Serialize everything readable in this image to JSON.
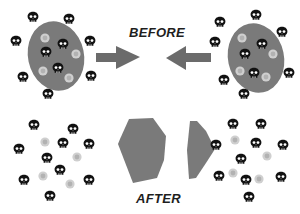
{
  "labels": {
    "before": "BEFORE",
    "after": "AFTER"
  },
  "colors": {
    "background": "#ffffff",
    "cell_body": "#7a7a7a",
    "arrow": "#6b6b6b",
    "skull": "#111111",
    "skull_eyes": "#ffffff",
    "light_particle": "#cfcfcf",
    "light_particle_center": "#a9a9a9"
  },
  "icons": {
    "skull": "skull-icon",
    "light_particle": "circle-icon",
    "arrow_right": "arrow-right-icon",
    "arrow_left": "arrow-left-icon"
  },
  "before": {
    "left_cell": {
      "ellipse": {
        "cx": 56,
        "cy": 56,
        "rx": 28,
        "ry": 35,
        "rotate": -12
      },
      "outer_skulls": [
        [
          33,
          17
        ],
        [
          69,
          19
        ],
        [
          16,
          41
        ],
        [
          90,
          41
        ],
        [
          23,
          77
        ],
        [
          91,
          76
        ],
        [
          48,
          94
        ]
      ],
      "inner_skulls": [
        [
          63,
          44
        ],
        [
          46,
          52
        ],
        [
          58,
          68
        ]
      ],
      "light_particles": [
        [
          45,
          38
        ],
        [
          76,
          54
        ],
        [
          43,
          71
        ],
        [
          69,
          78
        ]
      ]
    },
    "right_cell": {
      "ellipse": {
        "cx": 256,
        "cy": 58,
        "rx": 28,
        "ry": 35,
        "rotate": -12
      },
      "outer_skulls": [
        [
          220,
          22
        ],
        [
          256,
          15
        ],
        [
          282,
          32
        ],
        [
          215,
          42
        ],
        [
          289,
          73
        ],
        [
          224,
          80
        ],
        [
          244,
          94
        ]
      ],
      "inner_skulls": [
        [
          262,
          44
        ],
        [
          245,
          54
        ],
        [
          254,
          73
        ]
      ],
      "light_particles": [
        [
          242,
          38
        ],
        [
          273,
          54
        ],
        [
          240,
          71
        ],
        [
          266,
          77
        ]
      ]
    },
    "arrow_right": {
      "shaft": [
        96,
        53,
        116,
        62
      ],
      "head": [
        [
          116,
          46
        ],
        [
          140,
          57
        ],
        [
          116,
          69
        ]
      ]
    },
    "arrow_left": {
      "shaft": [
        186,
        53,
        211,
        62
      ],
      "head": [
        [
          186,
          46
        ],
        [
          166,
          58
        ],
        [
          186,
          70
        ]
      ]
    }
  },
  "after": {
    "left_group": {
      "skulls": [
        [
          34,
          125
        ],
        [
          73,
          129
        ],
        [
          19,
          149
        ],
        [
          63,
          143
        ],
        [
          89,
          144
        ],
        [
          47,
          158
        ],
        [
          60,
          170
        ],
        [
          24,
          180
        ],
        [
          89,
          180
        ],
        [
          50,
          196
        ]
      ],
      "light_particles": [
        [
          45,
          142
        ],
        [
          77,
          157
        ],
        [
          43,
          176
        ],
        [
          70,
          184
        ]
      ]
    },
    "right_group": {
      "skulls": [
        [
          233,
          124
        ],
        [
          261,
          124
        ],
        [
          216,
          145
        ],
        [
          256,
          143
        ],
        [
          283,
          145
        ],
        [
          241,
          159
        ],
        [
          219,
          176
        ],
        [
          246,
          180
        ],
        [
          281,
          177
        ],
        [
          249,
          197
        ]
      ],
      "light_particles": [
        [
          235,
          140
        ],
        [
          267,
          156
        ],
        [
          233,
          173
        ],
        [
          259,
          179
        ]
      ]
    },
    "fragments": [
      [
        [
          129,
          119
        ],
        [
          153,
          118
        ],
        [
          166,
          136
        ],
        [
          164,
          160
        ],
        [
          157,
          178
        ],
        [
          133,
          183
        ],
        [
          118,
          144
        ],
        [
          120,
          139
        ]
      ],
      [
        [
          190,
          121
        ],
        [
          197,
          121
        ],
        [
          206,
          131
        ],
        [
          215,
          149
        ],
        [
          206,
          163
        ],
        [
          196,
          178
        ],
        [
          189,
          179
        ],
        [
          187,
          150
        ]
      ]
    ]
  }
}
